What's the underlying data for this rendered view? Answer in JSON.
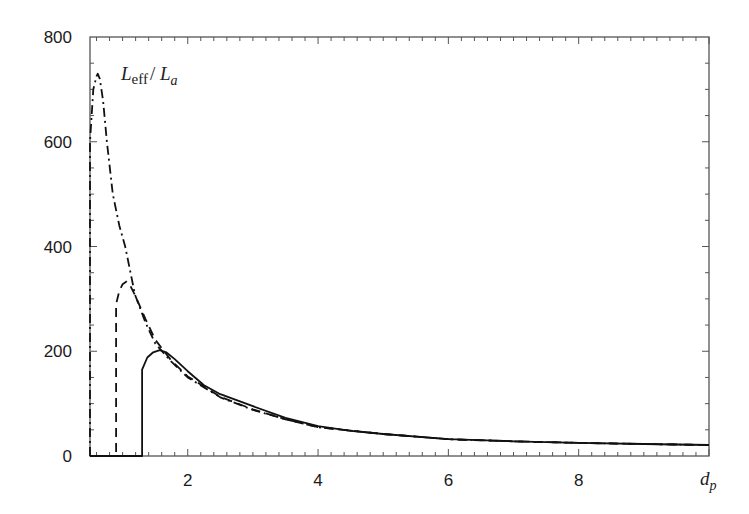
{
  "chart_data": {
    "type": "line",
    "title": "",
    "xlabel": "d_p",
    "ylabel": "L_eff / L_a",
    "xlim": [
      0.5,
      10
    ],
    "ylim": [
      0,
      800
    ],
    "grid": false,
    "legend": null,
    "x_ticks": [
      2,
      4,
      6,
      8
    ],
    "y_ticks": [
      0,
      200,
      400,
      600,
      800
    ],
    "annotations": [
      {
        "text": "L_eff / L_a",
        "x": 1.0,
        "y": 735
      }
    ],
    "series": [
      {
        "name": "dash-dot",
        "style": "dashdot",
        "x": [
          0.5,
          0.5,
          0.55,
          0.6,
          0.62,
          0.65,
          0.7,
          0.76,
          0.85,
          0.95,
          1.04,
          1.19,
          1.35,
          1.5,
          1.75,
          2.0,
          2.5,
          3.0,
          3.5,
          4.0,
          5.0,
          6.0,
          7.0,
          8.0,
          9.0,
          10.0
        ],
        "y": [
          0,
          600,
          700,
          725,
          730,
          720,
          680,
          600,
          500,
          440,
          400,
          308,
          255,
          215,
          180,
          150,
          112,
          88,
          70,
          55,
          42,
          32,
          28,
          25,
          23,
          21
        ]
      },
      {
        "name": "dashed",
        "style": "dashed",
        "x": [
          0.5,
          0.9,
          0.9,
          0.95,
          1.0,
          1.06,
          1.12,
          1.2,
          1.35,
          1.5,
          1.75,
          2.0,
          2.5,
          3.0,
          3.5,
          4.0,
          5.0,
          6.0,
          7.0,
          8.0,
          9.0,
          10.0
        ],
        "y": [
          0,
          0,
          290,
          315,
          328,
          333,
          325,
          305,
          262,
          222,
          182,
          152,
          113,
          89,
          70,
          55,
          42,
          32,
          28,
          25,
          23,
          21
        ]
      },
      {
        "name": "solid",
        "style": "solid",
        "x": [
          0.5,
          1.3,
          1.3,
          1.38,
          1.47,
          1.57,
          1.67,
          1.8,
          2.0,
          2.25,
          2.5,
          3.0,
          3.5,
          4.0,
          4.5,
          5.0,
          6.0,
          7.0,
          8.0,
          9.0,
          10.0
        ],
        "y": [
          0,
          0,
          165,
          188,
          198,
          202,
          198,
          185,
          162,
          135,
          118,
          95,
          73,
          57,
          48,
          42,
          32,
          28,
          25,
          23,
          21
        ]
      }
    ]
  },
  "labels": {
    "y_ticks": [
      "0",
      "200",
      "400",
      "600",
      "800"
    ],
    "x_ticks": [
      "2",
      "4",
      "6",
      "8"
    ],
    "annotation_main": "L",
    "annotation_sub1": "eff",
    "annotation_slash": "/ ",
    "annotation_main2": "L",
    "annotation_sub2": "a",
    "xlabel_main": "d",
    "xlabel_sub": "p"
  }
}
